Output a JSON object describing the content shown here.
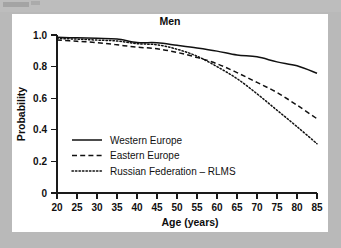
{
  "figure": {
    "title": "Men",
    "panel_background": "#ffffff",
    "outer_background": "#b9b9b9",
    "ink_color": "#111111"
  },
  "chart_data": {
    "type": "line",
    "title": "Men",
    "xlabel": "Age (years)",
    "ylabel": "Probability",
    "xlim": [
      20,
      85
    ],
    "ylim": [
      0,
      1.0
    ],
    "grid": false,
    "legend_position": "lower-left-inside",
    "xticks": [
      20,
      25,
      30,
      35,
      40,
      45,
      50,
      55,
      60,
      65,
      70,
      75,
      80,
      85
    ],
    "xticklabels": [
      "20",
      "25",
      "30",
      "35",
      "40",
      "45",
      "50",
      "55",
      "60",
      "65",
      "70",
      "75",
      "80",
      "85"
    ],
    "yticks": [
      0,
      0.2,
      0.4,
      0.6,
      0.8,
      1.0
    ],
    "yticklabels": [
      "0",
      "0.2",
      "0.4",
      "0.6",
      "0.8",
      "1.0"
    ],
    "x": [
      20,
      25,
      30,
      35,
      40,
      45,
      50,
      55,
      60,
      65,
      70,
      75,
      80,
      85
    ],
    "series": [
      {
        "name": "Western Europe",
        "style": "solid",
        "values": [
          0.985,
          0.982,
          0.979,
          0.975,
          0.953,
          0.951,
          0.935,
          0.918,
          0.898,
          0.873,
          0.862,
          0.83,
          0.805,
          0.758
        ]
      },
      {
        "name": "Eastern Europe",
        "style": "dashed",
        "values": [
          0.968,
          0.96,
          0.952,
          0.938,
          0.923,
          0.913,
          0.89,
          0.858,
          0.818,
          0.762,
          0.7,
          0.636,
          0.556,
          0.47
        ]
      },
      {
        "name": "Russian Federation – RLMS",
        "style": "dotted",
        "values": [
          0.978,
          0.974,
          0.968,
          0.962,
          0.945,
          0.938,
          0.91,
          0.866,
          0.8,
          0.724,
          0.628,
          0.524,
          0.42,
          0.312
        ]
      }
    ]
  },
  "legend": {
    "entries": [
      {
        "label": "Western Europe",
        "style": "solid"
      },
      {
        "label": "Eastern Europe",
        "style": "dashed"
      },
      {
        "label": "Russian Federation – RLMS",
        "style": "dotted"
      }
    ]
  }
}
